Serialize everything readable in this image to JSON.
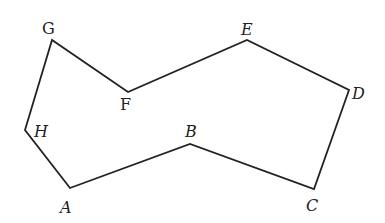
{
  "diagram": {
    "type": "polygon",
    "stroke_color": "#222222",
    "background": "#ffffff",
    "vertices": [
      {
        "name": "A",
        "x": 70,
        "y": 188,
        "label_x": 60,
        "label_y": 213
      },
      {
        "name": "B",
        "x": 190,
        "y": 144,
        "label_x": 185,
        "label_y": 137
      },
      {
        "name": "C",
        "x": 314,
        "y": 189,
        "label_x": 306,
        "label_y": 211
      },
      {
        "name": "D",
        "x": 349,
        "y": 90,
        "label_x": 352,
        "label_y": 99
      },
      {
        "name": "E",
        "x": 247,
        "y": 40,
        "label_x": 241,
        "label_y": 35
      },
      {
        "name": "F",
        "x": 128,
        "y": 92,
        "label_x": 120,
        "label_y": 110
      },
      {
        "name": "G",
        "x": 52,
        "y": 40,
        "label_x": 42,
        "label_y": 34
      },
      {
        "name": "H",
        "x": 25,
        "y": 130,
        "label_x": 34,
        "label_y": 137
      }
    ]
  }
}
